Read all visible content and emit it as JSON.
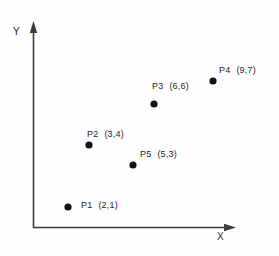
{
  "figure": {
    "background_color": "#fefefe",
    "axis_color": "#3a3a3a",
    "point_color": "#111111",
    "text_color": "#262626"
  },
  "axes": {
    "x_label": "X",
    "y_label": "Y"
  },
  "chart_data": {
    "type": "scatter",
    "title": "",
    "xlabel": "X",
    "ylabel": "Y",
    "grid": false,
    "legend": "none",
    "axis_arrows": true,
    "tick_labels": {
      "x": [],
      "y": []
    },
    "xlim": [
      0,
      10
    ],
    "ylim": [
      0,
      8
    ],
    "point_labels": [
      "P1",
      "P2",
      "P3",
      "P4",
      "P5"
    ],
    "x": [
      2,
      3,
      6,
      9,
      5
    ],
    "y": [
      1,
      4,
      6,
      7,
      3
    ],
    "points": [
      {
        "name": "P1",
        "x": 2,
        "y": 1,
        "coord_text": "(2,1)",
        "label_text": "P1  (2,1)",
        "px": 68,
        "py": 207,
        "label_left": 81,
        "label_top": 200
      },
      {
        "name": "P2",
        "x": 3,
        "y": 4,
        "coord_text": "(3,4)",
        "label_text": "P2  (3,4)",
        "px": 89,
        "py": 145,
        "label_left": 87,
        "label_top": 129
      },
      {
        "name": "P3",
        "x": 6,
        "y": 6,
        "coord_text": "(6,6)",
        "label_text": "P3  (6,6)",
        "px": 154,
        "py": 104,
        "label_left": 152,
        "label_top": 81
      },
      {
        "name": "P4",
        "x": 9,
        "y": 7,
        "coord_text": "(9,7)",
        "label_text": "P4  (9,7)",
        "px": 213,
        "py": 81,
        "label_left": 219,
        "label_top": 65
      },
      {
        "name": "P5",
        "x": 5,
        "y": 3,
        "coord_text": "(5,3)",
        "label_text": "P5  (5,3)",
        "px": 133,
        "py": 165,
        "label_left": 140,
        "label_top": 149
      }
    ]
  }
}
